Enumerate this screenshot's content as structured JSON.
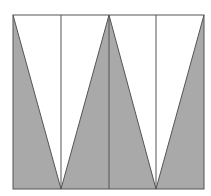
{
  "diagram": {
    "type": "geometric-figure",
    "colors": {
      "background": "#ffffff",
      "fill": "#a9a9a9",
      "stroke": "#555555"
    },
    "rectangle": {
      "x": 13,
      "y": 15,
      "width": 191,
      "height": 174
    },
    "vertical_lines_x": [
      61,
      109,
      156
    ],
    "shaded_triangles": [
      {
        "points": "13,15 13,189 61,189"
      },
      {
        "points": "109,15 61,189 156,189"
      },
      {
        "points": "204,15 204,189 156,189"
      }
    ],
    "zigzag_points": "13,15 61,189 109,15 156,189 204,15"
  }
}
